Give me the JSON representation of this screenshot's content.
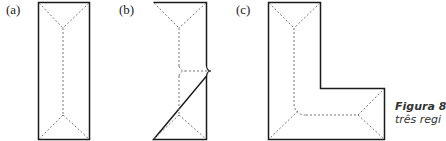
{
  "panels": [
    {
      "label": "(a)",
      "description": "Rectangular plan with hip roof ridge lines"
    },
    {
      "label": "(b)",
      "description": "Rectangular plan with ridge branching to one side"
    },
    {
      "label": "(c)",
      "description": "L-shaped plan with hip roof ridge lines"
    }
  ],
  "caption": {
    "title": "Figura 8",
    "text": "três regi"
  },
  "colors": {
    "outline": "#1a1a1a",
    "dashed": "#777777"
  }
}
